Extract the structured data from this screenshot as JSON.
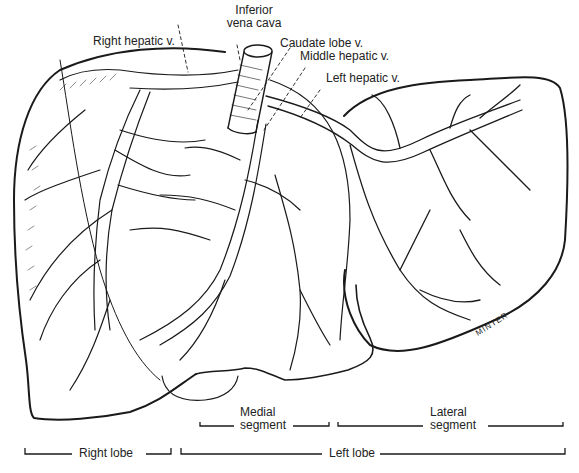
{
  "figure": {
    "labels": {
      "inferior_vena_cava": [
        "Inferior",
        "vena cava"
      ],
      "right_hepatic_v": "Right hepatic v.",
      "caudate_lobe_v": "Caudate lobe v.",
      "middle_hepatic_v": "Middle hepatic v.",
      "left_hepatic_v": "Left hepatic v."
    },
    "segments": {
      "medial": [
        "Medial",
        "segment"
      ],
      "lateral": [
        "Lateral",
        "segment"
      ]
    },
    "lobes": {
      "right": "Right lobe",
      "left": "Left lobe"
    },
    "signature": "MINTER",
    "colors": {
      "ink": "#1a1a1a",
      "background": "#ffffff"
    }
  }
}
